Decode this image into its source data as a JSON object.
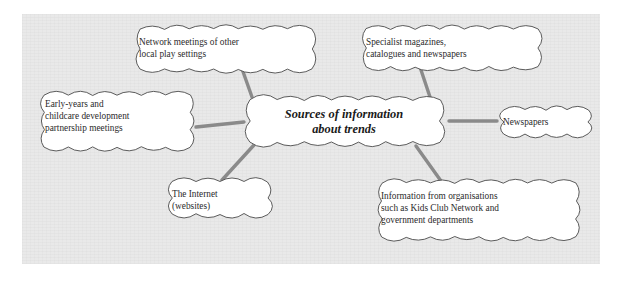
{
  "diagram": {
    "type": "mind-map",
    "title_node": {
      "id": "center",
      "text": "Sources of information\nabout trends",
      "style": "bold-italic"
    },
    "panel": {
      "background_color": "#e9e9e9",
      "page_background_color": "#ffffff"
    },
    "colors": {
      "cloud_fill": "#ffffff",
      "cloud_stroke": "#4a4a4a",
      "connector": "#8a8a8a",
      "text": "#2b2b2b"
    },
    "nodes": [
      {
        "id": "network-meetings",
        "text": "Network meetings of other\nlocal play settings",
        "position": "top-left"
      },
      {
        "id": "specialist-magazines",
        "text": "Specialist magazines,\ncatalogues and newspapers",
        "position": "top-right"
      },
      {
        "id": "early-years-partnership",
        "text": "Early-years and\nchildcare development\npartnership meetings",
        "position": "left"
      },
      {
        "id": "newspapers",
        "text": "Newspapers",
        "position": "right"
      },
      {
        "id": "the-internet",
        "text": "The Internet\n(websites)",
        "position": "bottom-left"
      },
      {
        "id": "organisations",
        "text": "Information from organisations\nsuch as Kids Club Network and\ngovernment departments",
        "position": "bottom-right"
      }
    ],
    "connectors": [
      {
        "from": "center",
        "to": "network-meetings"
      },
      {
        "from": "center",
        "to": "specialist-magazines"
      },
      {
        "from": "center",
        "to": "early-years-partnership"
      },
      {
        "from": "center",
        "to": "newspapers"
      },
      {
        "from": "center",
        "to": "the-internet"
      },
      {
        "from": "center",
        "to": "organisations"
      }
    ]
  }
}
